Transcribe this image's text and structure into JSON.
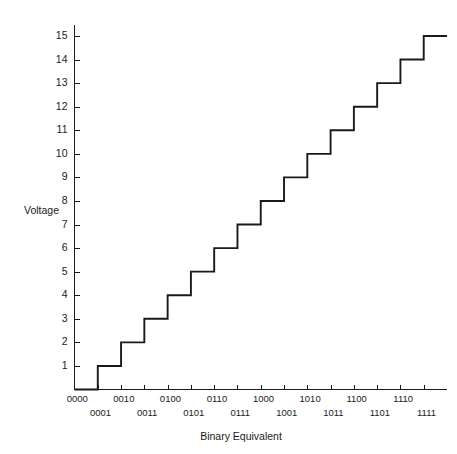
{
  "chart_data": {
    "type": "line",
    "subtype": "step-staircase",
    "title": "",
    "xlabel": "Binary Equivalent",
    "ylabel": "Voltage",
    "categories": [
      "0000",
      "0001",
      "0010",
      "0011",
      "0100",
      "0101",
      "0110",
      "0111",
      "1000",
      "1001",
      "1010",
      "1011",
      "1100",
      "1101",
      "1110",
      "1111"
    ],
    "values": [
      0,
      1,
      2,
      3,
      4,
      5,
      6,
      7,
      8,
      9,
      10,
      11,
      12,
      13,
      14,
      15
    ],
    "x": [
      0,
      1,
      2,
      3,
      4,
      5,
      6,
      7,
      8,
      9,
      10,
      11,
      12,
      13,
      14,
      15
    ],
    "xtick_labels": [
      "0000",
      "0001",
      "0010",
      "0011",
      "0100",
      "0101",
      "0110",
      "0111",
      "1000",
      "1001",
      "1010",
      "1011",
      "1100",
      "1101",
      "1110",
      "1111"
    ],
    "xtick_rows": [
      0,
      1,
      0,
      1,
      0,
      1,
      0,
      1,
      0,
      1,
      0,
      1,
      0,
      1,
      0,
      1
    ],
    "ytick_labels": [
      "1",
      "2",
      "3",
      "4",
      "5",
      "6",
      "7",
      "8",
      "9",
      "10",
      "11",
      "12",
      "13",
      "14",
      "15"
    ],
    "ytick_values": [
      1,
      2,
      3,
      4,
      5,
      6,
      7,
      8,
      9,
      10,
      11,
      12,
      13,
      14,
      15
    ],
    "ylim": [
      0,
      15.9
    ],
    "xlim": [
      0,
      16
    ],
    "grid": false,
    "legend": false,
    "legend_position": "none",
    "series": [
      {
        "name": "DAC output",
        "values": [
          0,
          1,
          2,
          3,
          4,
          5,
          6,
          7,
          8,
          9,
          10,
          11,
          12,
          13,
          14,
          15
        ]
      }
    ],
    "line_color": "#1a1a1a",
    "axis_color": "#1a1a1a",
    "background_color": "#ffffff"
  },
  "axes": {
    "y_title": "Voltage",
    "x_title": "Binary Equivalent"
  }
}
